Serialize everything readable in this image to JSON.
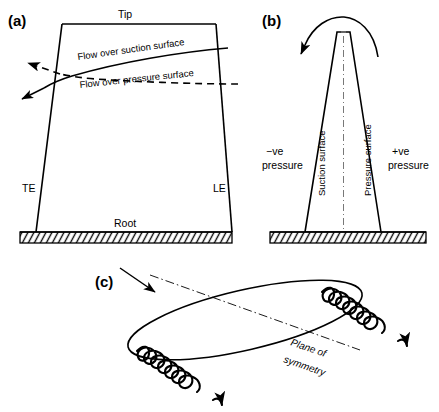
{
  "figure": {
    "background_color": "#ffffff",
    "ink_color": "#000000",
    "panels": [
      {
        "id": "a",
        "label": "(a)",
        "labels": {
          "tip": "Tip",
          "root": "Root",
          "trailing_edge": "TE",
          "leading_edge": "LE",
          "flow_suction": "Flow over suction surface",
          "flow_pressure": "Flow over pressure surface"
        }
      },
      {
        "id": "b",
        "label": "(b)",
        "labels": {
          "negative_pressure_line1": "−ve",
          "negative_pressure_line2": "pressure",
          "positive_pressure_line1": "+ve",
          "positive_pressure_line2": "pressure",
          "suction_surface": "Suction surface",
          "pressure_surface": "Pressure surface"
        }
      },
      {
        "id": "c",
        "label": "(c)",
        "labels": {
          "plane_of_symmetry_line1": "Plane of",
          "plane_of_symmetry_line2": "symmetry"
        }
      }
    ]
  }
}
